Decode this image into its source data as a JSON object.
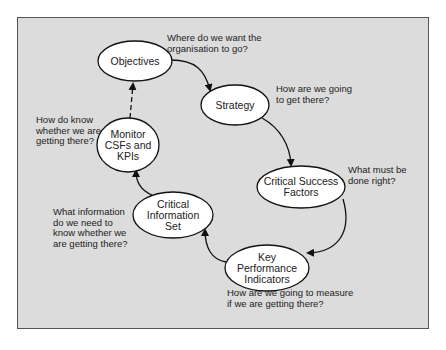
{
  "diagram": {
    "nodes": [
      {
        "id": "objectives",
        "label": "Objectives"
      },
      {
        "id": "strategy",
        "label": "Strategy"
      },
      {
        "id": "csf",
        "label": "Critical Success\nFactors"
      },
      {
        "id": "kpi",
        "label": "Key\nPerformance\nIndicators"
      },
      {
        "id": "cis",
        "label": "Critical\nInformation\nSet"
      },
      {
        "id": "monitor",
        "label": "Monitor\nCSFs and\nKPIs"
      }
    ],
    "notes": [
      {
        "for": "objectives",
        "text": "Where do we want the\norganisation to go?"
      },
      {
        "for": "strategy",
        "text": "How are we going\nto get there?"
      },
      {
        "for": "csf",
        "text": "What must be\ndone right?"
      },
      {
        "for": "kpi",
        "text": "How are we going to measure\nif we are getting there?"
      },
      {
        "for": "cis",
        "text": "What information\ndo we need to\nknow whether we\nare getting there?"
      },
      {
        "for": "monitor",
        "text": "How do know\nwhether we are\ngetting there?"
      }
    ],
    "edges": [
      {
        "from": "objectives",
        "to": "strategy",
        "style": "solid"
      },
      {
        "from": "strategy",
        "to": "csf",
        "style": "solid"
      },
      {
        "from": "csf",
        "to": "kpi",
        "style": "solid"
      },
      {
        "from": "kpi",
        "to": "cis",
        "style": "solid"
      },
      {
        "from": "cis",
        "to": "monitor",
        "style": "solid"
      },
      {
        "from": "monitor",
        "to": "objectives",
        "style": "dashed"
      }
    ]
  }
}
